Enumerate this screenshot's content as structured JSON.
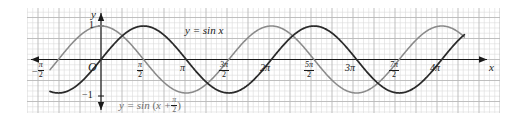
{
  "figure": {
    "background": "#ffffff",
    "grid_color_minor": "#d8d8d8",
    "grid_color_major": "#b6b6b6",
    "axis_color": "#1a1a1a",
    "curve_color_sin": "#2a2a2a",
    "curve_color_shifted": "#8a8a8a"
  },
  "axes": {
    "x_axis_label": "x",
    "y_axis_label": "y",
    "origin_label": "O",
    "y_ticks": [
      {
        "label": "1",
        "value": 1
      },
      {
        "label": "−1",
        "value": -1
      }
    ],
    "x_ticks": [
      {
        "label": "−π/2",
        "value": -1.5707963,
        "style": "frac",
        "sign": "−",
        "num": "π",
        "den": "2"
      },
      {
        "label": "π/2",
        "value": 1.5707963,
        "style": "frac",
        "sign": "",
        "num": "π",
        "den": "2"
      },
      {
        "label": "π",
        "value": 3.1415927,
        "style": "plain"
      },
      {
        "label": "3π/2",
        "value": 4.712389,
        "style": "frac",
        "sign": "",
        "num": "3π",
        "den": "2"
      },
      {
        "label": "2π",
        "value": 6.2831853,
        "style": "plain"
      },
      {
        "label": "5π/2",
        "value": 7.8539816,
        "style": "frac",
        "sign": "",
        "num": "5π",
        "den": "2"
      },
      {
        "label": "3π",
        "value": 9.424778,
        "style": "plain"
      },
      {
        "label": "7π/2",
        "value": 10.9955743,
        "style": "frac",
        "sign": "",
        "num": "7π",
        "den": "2"
      },
      {
        "label": "4π",
        "value": 12.5663706,
        "style": "plain"
      }
    ]
  },
  "annotations": {
    "curve_label_sin": "y = sin x",
    "curve_label_shifted_prefix": "y = sin",
    "curve_label_shifted_inner": "x +",
    "curve_label_shifted_num": "π",
    "curve_label_shifted_den": "2"
  },
  "chart_data": {
    "type": "line",
    "title": "",
    "xlabel": "x",
    "ylabel": "y",
    "xlim": [
      -1.88,
      13.4
    ],
    "ylim": [
      -1.28,
      1.28
    ],
    "grid": true,
    "legend": "inline-annotations",
    "x_tick_values": [
      -1.5707963,
      1.5707963,
      3.1415927,
      4.712389,
      6.2831853,
      7.8539816,
      9.424778,
      10.9955743,
      12.5663706
    ],
    "x_tick_labels": [
      "−π/2",
      "π/2",
      "π",
      "3π/2",
      "2π",
      "5π/2",
      "3π",
      "7π/2",
      "4π"
    ],
    "y_tick_values": [
      -1,
      1
    ],
    "y_tick_labels": [
      "−1",
      "1"
    ],
    "series": [
      {
        "name": "y = sin x",
        "color": "#2a2a2a",
        "formula": "sin(x)",
        "amplitude": 1,
        "period": 6.2831853,
        "phase": 0,
        "domain": [
          -1.88,
          13.4
        ],
        "key_points": [
          {
            "x": -1.5707963,
            "y": -1
          },
          {
            "x": 0,
            "y": 0
          },
          {
            "x": 1.5707963,
            "y": 1
          },
          {
            "x": 3.1415927,
            "y": 0
          },
          {
            "x": 4.712389,
            "y": -1
          },
          {
            "x": 6.2831853,
            "y": 0
          },
          {
            "x": 7.8539816,
            "y": 1
          },
          {
            "x": 9.424778,
            "y": 0
          },
          {
            "x": 10.9955743,
            "y": -1
          },
          {
            "x": 12.5663706,
            "y": 0
          }
        ]
      },
      {
        "name": "y = sin(x + π/2)",
        "color": "#8a8a8a",
        "formula": "sin(x + pi/2)",
        "amplitude": 1,
        "period": 6.2831853,
        "phase": 1.5707963,
        "domain": [
          -1.88,
          13.4
        ],
        "key_points": [
          {
            "x": -1.5707963,
            "y": 0
          },
          {
            "x": 0,
            "y": 1
          },
          {
            "x": 1.5707963,
            "y": 0
          },
          {
            "x": 3.1415927,
            "y": -1
          },
          {
            "x": 4.712389,
            "y": 0
          },
          {
            "x": 6.2831853,
            "y": 1
          },
          {
            "x": 7.8539816,
            "y": 0
          },
          {
            "x": 9.424778,
            "y": -1
          },
          {
            "x": 10.9955743,
            "y": 0
          },
          {
            "x": 12.5663706,
            "y": 1
          }
        ]
      }
    ]
  }
}
